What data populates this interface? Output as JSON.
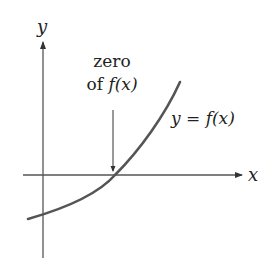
{
  "diagram": {
    "axes": {
      "x_label": "x",
      "y_label": "y"
    },
    "annotation": {
      "line1": "zero",
      "line2_prefix": "of ",
      "line2_func": "f(x)"
    },
    "curve_label": {
      "lhs": "y",
      "eq": " = ",
      "rhs": "f(x)"
    },
    "colors": {
      "axis": "#555555",
      "curve": "#555555",
      "text": "#222222",
      "background": "#ffffff"
    }
  }
}
